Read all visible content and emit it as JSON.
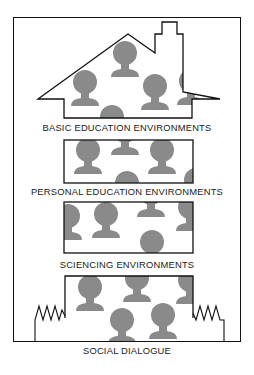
{
  "diagram": {
    "labels": {
      "basic": "BASIC EDUCATION ENVIRONMENTS",
      "personal": "PERSONAL EDUCATION ENVIRONMENTS",
      "sciencing": "SCIENCING ENVIRONMENTS",
      "social": "SOCIAL DIALOGUE"
    },
    "colors": {
      "line": "#111111",
      "figure": "#8a8a8a",
      "background": "#ffffff"
    }
  }
}
